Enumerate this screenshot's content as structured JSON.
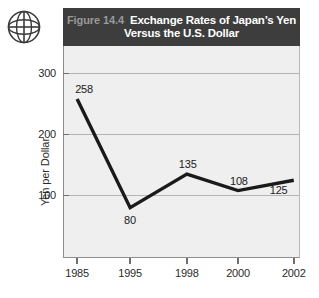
{
  "figure": {
    "label": "Figure 14.4",
    "title_line_1": "Exchange Rates of Japan’s Yen",
    "title_line_2": "Versus the U.S. Dollar",
    "icon": "globe-icon",
    "header_background": "#3d3d3d",
    "header_label_color": "#9a9a9a",
    "header_title_color": "#ffffff"
  },
  "chart_data": {
    "type": "line",
    "title": "Figure 14.4 Exchange Rates of Japan’s Yen Versus the U.S. Dollar",
    "xlabel": "",
    "ylabel": "Yen per Dollar",
    "categories": [
      "1985",
      "1995",
      "1998",
      "2000",
      "2002"
    ],
    "values": [
      258,
      80,
      135,
      108,
      125
    ],
    "point_labels": [
      "258",
      "80",
      "135",
      "108",
      "125"
    ],
    "x_tick_labels": [
      "1985",
      "1995",
      "1998",
      "2000",
      "2002"
    ],
    "y_tick_labels": [
      "100",
      "200",
      "300"
    ],
    "y_ticks": [
      100,
      200,
      300
    ],
    "ylim": [
      0,
      345
    ],
    "grid": true,
    "legend": null,
    "series": [
      {
        "name": "Yen per U.S. Dollar",
        "values": [
          258,
          80,
          135,
          108,
          125
        ],
        "color": "#1a1a1a"
      }
    ],
    "plot_background": "#efefef",
    "line_color": "#1a1a1a",
    "grid_color": "#b4b4b4"
  }
}
